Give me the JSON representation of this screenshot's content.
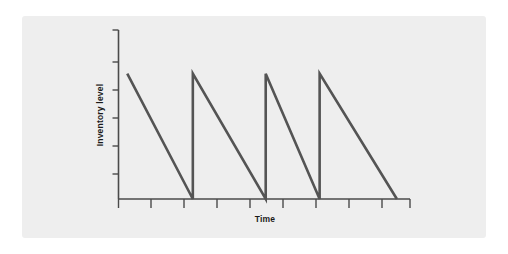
{
  "figure": {
    "background_color": "#ffffff",
    "panel_color": "#eeeeee",
    "line_color": "#545454",
    "axis_color": "#4a4a4a"
  },
  "chart_data": {
    "type": "line",
    "title": "",
    "subtitle": "",
    "xlabel": "Time",
    "ylabel": "Inventory level",
    "grid": false,
    "legend": null,
    "annotations": [],
    "xlim": [
      0,
      10
    ],
    "ylim": [
      0,
      6
    ],
    "x_tick_count": 10,
    "y_tick_count": 6,
    "x_tick_labels": [
      "",
      "",
      "",
      "",
      "",
      "",
      "",
      "",
      "",
      ""
    ],
    "y_tick_labels": [
      "",
      "",
      "",
      "",
      "",
      ""
    ],
    "series": [
      {
        "name": "Inventory level",
        "color": "#545454",
        "x": [
          0.3,
          2.55,
          2.55,
          5.05,
          5.05,
          6.9,
          6.9,
          9.55
        ],
        "y": [
          4.45,
          0.0,
          4.45,
          0.0,
          4.45,
          0.0,
          4.45,
          0.0
        ]
      }
    ],
    "cycles": [
      {
        "start_x": 0.3,
        "end_x": 2.55,
        "peak_y": 4.45,
        "trough_y": 0.0
      },
      {
        "start_x": 2.55,
        "end_x": 5.05,
        "peak_y": 4.45,
        "trough_y": 0.0
      },
      {
        "start_x": 5.05,
        "end_x": 6.9,
        "peak_y": 4.45,
        "trough_y": 0.0
      },
      {
        "start_x": 6.9,
        "end_x": 9.55,
        "peak_y": 4.45,
        "trough_y": 0.0
      }
    ]
  }
}
